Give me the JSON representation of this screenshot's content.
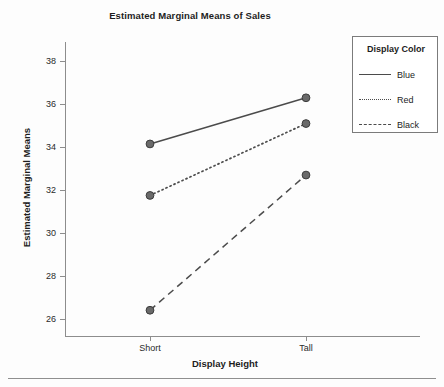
{
  "chart_data": {
    "type": "line",
    "title": "Estimated Marginal Means of Sales",
    "xlabel": "Display Height",
    "ylabel": "Estimated Marginal Means",
    "categories": [
      "Short",
      "Tall"
    ],
    "series": [
      {
        "name": "Blue",
        "values": [
          34.15,
          36.3
        ],
        "linestyle": "solid",
        "color": "#4b4b4b"
      },
      {
        "name": "Red",
        "values": [
          31.75,
          35.1
        ],
        "linestyle": "dotted",
        "color": "#4b4b4b"
      },
      {
        "name": "Black",
        "values": [
          26.4,
          32.7
        ],
        "linestyle": "dashed",
        "color": "#4b4b4b"
      }
    ],
    "yticks": [
      26,
      28,
      30,
      32,
      34,
      36,
      38
    ],
    "ytick_labels": [
      "26",
      "28",
      "30",
      "32",
      "34",
      "36",
      "38"
    ],
    "ylim": [
      25.2,
      38.9
    ],
    "grid": false,
    "legend": {
      "title": "Display Color",
      "position": "right-top"
    },
    "marker": "filled-circle"
  },
  "legend": {
    "title": "Display Color",
    "entries": [
      {
        "label": "Blue",
        "style": "solid"
      },
      {
        "label": "Red",
        "style": "dotted"
      },
      {
        "label": "Black",
        "style": "dashed"
      }
    ]
  },
  "axes": {
    "x_tick_labels": [
      "Short",
      "Tall"
    ],
    "y_tick_labels": [
      "38",
      "36",
      "34",
      "32",
      "30",
      "28",
      "26"
    ]
  }
}
